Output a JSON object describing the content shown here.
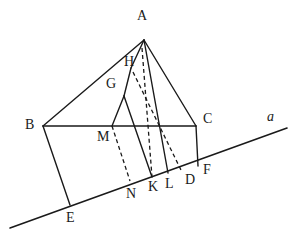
{
  "figure": {
    "type": "geometry-diagram",
    "stroke_color": "#1a1a1a",
    "background_color": "#ffffff",
    "stroke_width": 1.4,
    "dash_pattern": "4,3"
  },
  "points": {
    "A": {
      "label": "A",
      "x": 144,
      "y": 40,
      "label_x": 137,
      "label_y": 9
    },
    "B": {
      "label": "B",
      "x": 43,
      "y": 126,
      "label_x": 25,
      "label_y": 118
    },
    "C": {
      "label": "C",
      "x": 196,
      "y": 126,
      "label_x": 203,
      "label_y": 112
    },
    "D": {
      "label": "D",
      "x": 181,
      "y": 170,
      "label_x": 185,
      "label_y": 173
    },
    "E": {
      "label": "E",
      "x": 70,
      "y": 205,
      "label_x": 66,
      "label_y": 211
    },
    "F": {
      "label": "F",
      "x": 198,
      "y": 166,
      "label_x": 203,
      "label_y": 163
    },
    "G": {
      "label": "G",
      "x": 124,
      "y": 95,
      "label_x": 106,
      "label_y": 77
    },
    "H": {
      "label": "H",
      "x": 133,
      "y": 72,
      "label_x": 124,
      "label_y": 55
    },
    "K": {
      "label": "K",
      "x": 152,
      "y": 177,
      "label_x": 148,
      "label_y": 180
    },
    "L": {
      "label": "L",
      "x": 168,
      "y": 173,
      "label_x": 165,
      "label_y": 177
    },
    "M": {
      "label": "M",
      "x": 112,
      "y": 126,
      "label_x": 97,
      "label_y": 130
    },
    "N": {
      "label": "N",
      "x": 130,
      "y": 181,
      "label_x": 126,
      "label_y": 187
    }
  },
  "line_a": {
    "label": "a",
    "start_x": 10,
    "start_y": 228,
    "end_x": 287,
    "end_y": 128,
    "label_x": 267,
    "label_y": 110
  },
  "segments": [
    {
      "name": "segment-B-A",
      "from": "B",
      "to": "A",
      "style": "solid"
    },
    {
      "name": "segment-A-C",
      "from": "A",
      "to": "C",
      "style": "solid"
    },
    {
      "name": "segment-B-C",
      "from": "B",
      "to": "C",
      "style": "solid"
    },
    {
      "name": "segment-B-E",
      "from": "B",
      "to": "E",
      "style": "solid"
    },
    {
      "name": "segment-C-F",
      "from": "C",
      "to": "F",
      "style": "solid"
    },
    {
      "name": "segment-A-L",
      "from": "A",
      "to": "L",
      "style": "solid"
    },
    {
      "name": "segment-A-H",
      "from": "A",
      "to": "H",
      "style": "solid"
    },
    {
      "name": "segment-H-G",
      "from": "H",
      "to": "G",
      "style": "solid"
    },
    {
      "name": "segment-G-M",
      "from": "G",
      "to": "M",
      "style": "solid"
    },
    {
      "name": "segment-G-K",
      "from": "G",
      "to": "K",
      "style": "solid"
    },
    {
      "name": "segment-A-K-dashed",
      "from": "A",
      "to": "K",
      "style": "dashed"
    },
    {
      "name": "segment-M-N-dashed",
      "from": "M",
      "to": "N",
      "style": "dashed"
    },
    {
      "name": "segment-H-D-dashed",
      "from": "H",
      "to": "D",
      "style": "dashed"
    }
  ]
}
